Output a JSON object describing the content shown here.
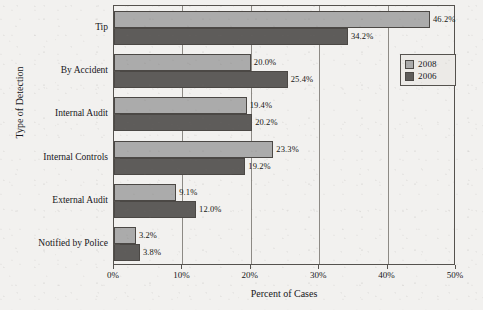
{
  "chart_data": {
    "type": "bar",
    "orientation": "horizontal",
    "title": "",
    "xlabel": "Percent of Cases",
    "ylabel": "Type of Detection",
    "xlim": [
      0,
      50
    ],
    "xticks": [
      "0%",
      "10%",
      "20%",
      "30%",
      "40%",
      "50%"
    ],
    "xtick_values": [
      0,
      10,
      20,
      30,
      40,
      50
    ],
    "grid": "vertical",
    "legend_position": "upper-right",
    "categories": [
      "Tip",
      "By Accident",
      "Internal Audit",
      "Internal Controls",
      "External Audit",
      "Notified by Police"
    ],
    "series": [
      {
        "name": "2008",
        "color": "#ababab",
        "values": [
          46.2,
          20.0,
          19.4,
          23.3,
          9.1,
          3.2
        ],
        "labels": [
          "46.2%",
          "20.0%",
          "19.4%",
          "23.3%",
          "9.1%",
          "3.2%"
        ]
      },
      {
        "name": "2006",
        "color": "#5e5c5a",
        "values": [
          34.2,
          25.4,
          20.2,
          19.2,
          12.0,
          3.8
        ],
        "labels": [
          "34.2%",
          "25.4%",
          "20.2%",
          "19.2%",
          "12.0%",
          "3.8%"
        ]
      }
    ],
    "legend": [
      {
        "label": "2008",
        "color": "#ababab"
      },
      {
        "label": "2006",
        "color": "#5e5c5a"
      }
    ]
  }
}
